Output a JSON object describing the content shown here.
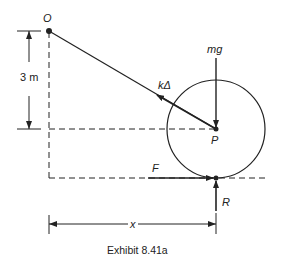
{
  "diagram": {
    "caption": "Exhibit 8.41a",
    "points": {
      "O": {
        "label": "O"
      },
      "P": {
        "label": "P"
      }
    },
    "forces": {
      "weight": {
        "label": "mg"
      },
      "spring": {
        "label": "kΔ"
      },
      "friction": {
        "label": "F"
      },
      "normal": {
        "label": "R"
      }
    },
    "dimensions": {
      "height": {
        "label": "3 m"
      },
      "horizontal": {
        "label": "x"
      }
    },
    "colors": {
      "line": "#222222",
      "background": "#ffffff"
    }
  }
}
